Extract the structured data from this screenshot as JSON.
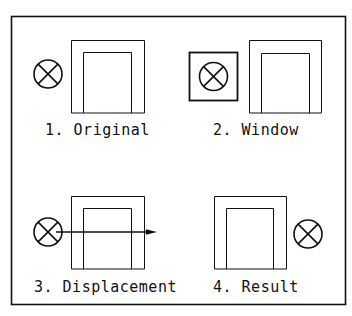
{
  "diagram": {
    "colors": {
      "stroke": "#111111",
      "background": "#ffffff"
    },
    "panels": [
      {
        "id": 1,
        "label": "1. Original"
      },
      {
        "id": 2,
        "label": "2. Window"
      },
      {
        "id": 3,
        "label": "3. Displacement"
      },
      {
        "id": 4,
        "label": "4. Result"
      }
    ],
    "icons": {
      "lamp": "circle-with-x-icon",
      "doorway": "doorway-frame-icon",
      "arrow": "right-arrow-icon"
    }
  }
}
